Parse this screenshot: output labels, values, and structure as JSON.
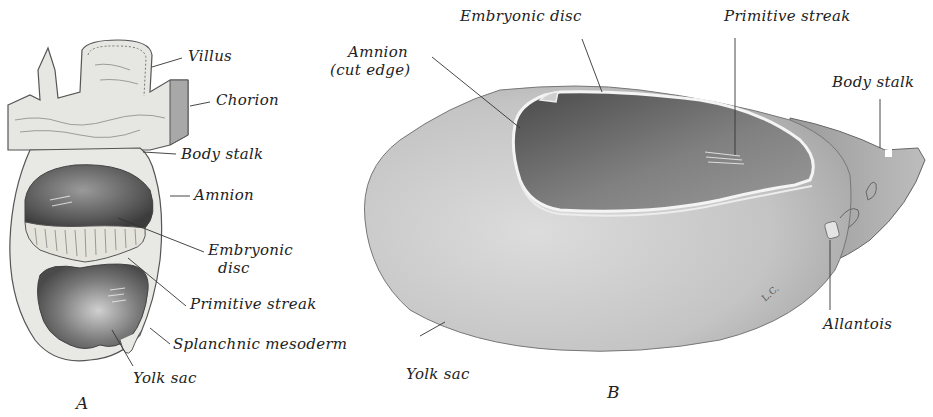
{
  "figure": {
    "panel_a": {
      "letter": "A",
      "labels": {
        "villus": "Villus",
        "chorion": "Chorion",
        "body_stalk": "Body stalk",
        "amnion": "Amnion",
        "embryonic_disc_1": "Embryonic",
        "embryonic_disc_2": "disc",
        "primitive_streak": "Primitive streak",
        "splanchnic_mesoderm": "Splanchnic mesoderm",
        "yolk_sac": "Yolk sac"
      }
    },
    "panel_b": {
      "letter": "B",
      "labels": {
        "amnion_1": "Amnion",
        "amnion_2": "(cut edge)",
        "embryonic_disc": "Embryonic disc",
        "primitive_streak": "Primitive streak",
        "body_stalk": "Body stalk",
        "allantois": "Allantois",
        "yolk_sac": "Yolk sac",
        "artist_initials": "L.C."
      }
    }
  }
}
